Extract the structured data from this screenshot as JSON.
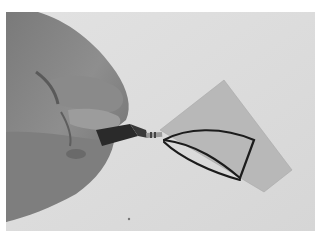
{
  "image": {
    "kind": "photograph",
    "subject": "hand tracing outline on card",
    "tone": "grayscale",
    "colors": {
      "border": "#ffffff",
      "background": "#dcdcdc",
      "card": "#b9b9b9",
      "skin_light": "#9a9a9a",
      "skin_shadow": "#5a5a5a",
      "tube": "#2a2a2a",
      "outline": "#1a1a1a"
    }
  }
}
